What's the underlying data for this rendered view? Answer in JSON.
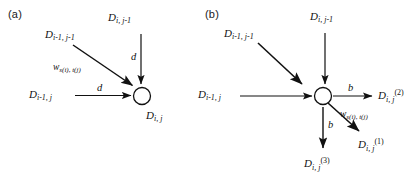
{
  "figure": {
    "background": "#ffffff",
    "stroke_color": "#111111",
    "panels": [
      {
        "id": "a",
        "label": "(a)",
        "node": {
          "name": "center-node",
          "shape": "circle",
          "label_base": "D",
          "label_sub": "i, j"
        },
        "inputs": [
          {
            "name": "input-diagonal",
            "label_base": "D",
            "label_sub": "i-1, j-1",
            "edge_label_base": "w",
            "edge_label_sub": "s(i), t(j)",
            "direction": "diagonal-down-right"
          },
          {
            "name": "input-top",
            "label_base": "D",
            "label_sub": "i, j-1",
            "edge_label_base": "d",
            "edge_label_sub": "",
            "direction": "down"
          },
          {
            "name": "input-left",
            "label_base": "D",
            "label_sub": "i-1, j",
            "edge_label_base": "d",
            "edge_label_sub": "",
            "direction": "right"
          }
        ],
        "outputs": []
      },
      {
        "id": "b",
        "label": "(b)",
        "node": {
          "name": "center-node",
          "shape": "circle",
          "label_base": "",
          "label_sub": ""
        },
        "inputs": [
          {
            "name": "input-diagonal",
            "label_base": "D",
            "label_sub": "i-1, j-1",
            "edge_label_base": "",
            "edge_label_sub": "",
            "direction": "diagonal-down-right"
          },
          {
            "name": "input-top",
            "label_base": "D",
            "label_sub": "i, j-1",
            "edge_label_base": "",
            "edge_label_sub": "",
            "direction": "down"
          },
          {
            "name": "input-left",
            "label_base": "D",
            "label_sub": "i-1, j",
            "edge_label_base": "",
            "edge_label_sub": "",
            "direction": "right"
          }
        ],
        "outputs": [
          {
            "name": "output-right",
            "label_base": "D",
            "label_sub": "i, j",
            "label_sup": "(2)",
            "edge_label_base": "b",
            "edge_label_sub": "",
            "direction": "right"
          },
          {
            "name": "output-diagonal",
            "label_base": "D",
            "label_sub": "i, j",
            "label_sup": "(1)",
            "edge_label_base": "w",
            "edge_label_sub": "s(i), t(j)",
            "direction": "diagonal-down-right"
          },
          {
            "name": "output-bottom",
            "label_base": "D",
            "label_sub": "i, j",
            "label_sup": "(3)",
            "edge_label_base": "b",
            "edge_label_sub": "",
            "direction": "down"
          }
        ]
      }
    ]
  }
}
